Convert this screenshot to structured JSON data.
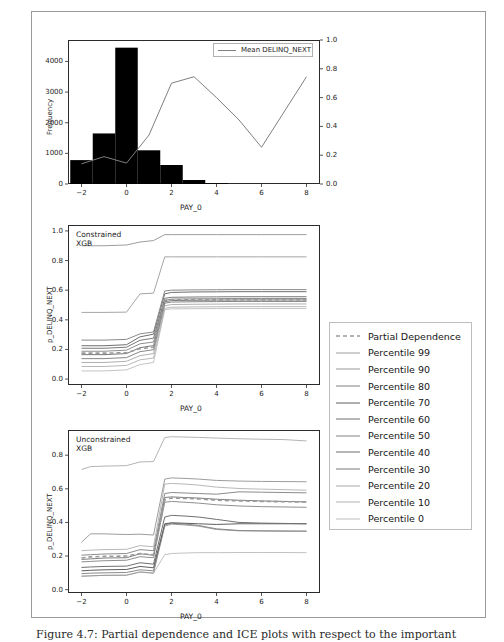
{
  "figure": {
    "caption": "Figure 4.7: Partial dependence and ICE plots with respect to the important",
    "background": "#ffffff",
    "frame_color": "#9a9a9a"
  },
  "chart_data": [
    {
      "id": "top-histogram",
      "type": "bar",
      "title": "",
      "xlabel": "PAY_0",
      "ylabel": "Frequency",
      "y2label": "",
      "xlim": [
        -2.6,
        8.6
      ],
      "ylim": [
        0,
        4700
      ],
      "y2lim": [
        0.0,
        1.0
      ],
      "xticks": [
        -2,
        0,
        2,
        4,
        6,
        8
      ],
      "yticks": [
        0,
        1000,
        2000,
        3000,
        4000
      ],
      "y2ticks": [
        0.0,
        0.2,
        0.4,
        0.6,
        0.8,
        1.0
      ],
      "grid": false,
      "bar_color": "#000000",
      "categories": [
        -2,
        -1,
        0,
        1,
        2,
        3,
        4
      ],
      "values": [
        780,
        1650,
        4450,
        1100,
        620,
        130,
        25
      ],
      "series": [
        {
          "name": "Mean DELINQ_NEXT",
          "type": "line",
          "color": "#7f7f7f",
          "axis": "y2",
          "x": [
            -2,
            -1,
            0,
            1,
            2,
            3,
            4,
            5,
            6,
            7,
            8
          ],
          "values": [
            0.14,
            0.19,
            0.145,
            0.34,
            0.7,
            0.745,
            0.6,
            0.445,
            0.255,
            0.5,
            0.745
          ]
        }
      ],
      "legend": {
        "position": "upper center",
        "entries": [
          "Mean DELINQ_NEXT"
        ]
      }
    },
    {
      "id": "middle-constrained",
      "type": "line",
      "annotation": "Constrained\nXGB",
      "xlabel": "PAY_0",
      "ylabel": "p_DELINQ_NEXT",
      "xlim": [
        -2.6,
        8.6
      ],
      "ylim": [
        -0.04,
        1.04
      ],
      "xticks": [
        -2,
        0,
        2,
        4,
        6,
        8
      ],
      "yticks": [
        0.0,
        0.2,
        0.4,
        0.6,
        0.8,
        1.0
      ],
      "grid": false,
      "x": [
        -2,
        -1,
        0,
        0.6,
        1.2,
        1.7,
        2,
        3,
        4,
        5,
        6,
        7,
        8
      ],
      "series": [
        {
          "name": "Partial Dependence",
          "dashed": true,
          "color": "#9a9a9a",
          "values": [
            0.175,
            0.175,
            0.178,
            0.205,
            0.215,
            0.53,
            0.535,
            0.535,
            0.535,
            0.535,
            0.535,
            0.535,
            0.535
          ]
        },
        {
          "name": "Percentile 99",
          "color": "#9d9d9d",
          "values": [
            0.9,
            0.9,
            0.905,
            0.925,
            0.935,
            0.975,
            0.975,
            0.975,
            0.975,
            0.975,
            0.975,
            0.975,
            0.975
          ]
        },
        {
          "name": "Percentile 90",
          "color": "#a6a6a6",
          "values": [
            0.45,
            0.45,
            0.452,
            0.575,
            0.58,
            0.825,
            0.825,
            0.825,
            0.825,
            0.825,
            0.825,
            0.825,
            0.825
          ]
        },
        {
          "name": "Percentile 80",
          "color": "#8a8a8a",
          "values": [
            0.263,
            0.263,
            0.268,
            0.305,
            0.318,
            0.595,
            0.6,
            0.602,
            0.603,
            0.604,
            0.604,
            0.604,
            0.604
          ]
        },
        {
          "name": "Percentile 70",
          "color": "#6e6e6e",
          "values": [
            0.225,
            0.225,
            0.232,
            0.285,
            0.303,
            0.575,
            0.585,
            0.588,
            0.589,
            0.59,
            0.59,
            0.59,
            0.59
          ]
        },
        {
          "name": "Percentile 60",
          "color": "#7a7a7a",
          "values": [
            0.208,
            0.208,
            0.215,
            0.262,
            0.276,
            0.545,
            0.552,
            0.554,
            0.555,
            0.556,
            0.556,
            0.556,
            0.556
          ]
        },
        {
          "name": "Percentile 50",
          "color": "#8f8f8f",
          "values": [
            0.188,
            0.188,
            0.195,
            0.238,
            0.25,
            0.532,
            0.54,
            0.542,
            0.543,
            0.544,
            0.544,
            0.544,
            0.544
          ]
        },
        {
          "name": "Percentile 40",
          "color": "#787878",
          "values": [
            0.165,
            0.165,
            0.172,
            0.212,
            0.226,
            0.522,
            0.53,
            0.532,
            0.533,
            0.534,
            0.534,
            0.534,
            0.534
          ]
        },
        {
          "name": "Percentile 30",
          "color": "#868686",
          "values": [
            0.138,
            0.138,
            0.145,
            0.185,
            0.198,
            0.512,
            0.52,
            0.522,
            0.523,
            0.524,
            0.524,
            0.524,
            0.524
          ]
        },
        {
          "name": "Percentile 20",
          "color": "#b0b0b0",
          "values": [
            0.112,
            0.112,
            0.12,
            0.158,
            0.172,
            0.495,
            0.503,
            0.505,
            0.506,
            0.507,
            0.507,
            0.507,
            0.507
          ]
        },
        {
          "name": "Percentile 10",
          "color": "#b8b8b8",
          "values": [
            0.085,
            0.085,
            0.092,
            0.13,
            0.142,
            0.478,
            0.485,
            0.487,
            0.488,
            0.489,
            0.489,
            0.489,
            0.489
          ]
        },
        {
          "name": "Percentile 0",
          "color": "#c4c4c4",
          "values": [
            0.055,
            0.055,
            0.062,
            0.098,
            0.112,
            0.468,
            0.474,
            0.475,
            0.476,
            0.476,
            0.476,
            0.476,
            0.476
          ]
        }
      ]
    },
    {
      "id": "bottom-unconstrained",
      "type": "line",
      "annotation": "Unconstrained\nXGB",
      "xlabel": "PAY_0",
      "ylabel": "p_DELINQ_NEXT",
      "xlim": [
        -2.6,
        8.6
      ],
      "ylim": [
        -0.02,
        0.95
      ],
      "xticks": [
        -2,
        0,
        2,
        4,
        6,
        8
      ],
      "yticks": [
        0.0,
        0.2,
        0.4,
        0.6,
        0.8
      ],
      "grid": false,
      "x": [
        -2,
        -1.6,
        -1,
        0,
        0.6,
        1.2,
        1.7,
        2,
        2.6,
        3.2,
        4,
        5,
        6,
        7,
        8
      ],
      "series": [
        {
          "name": "Partial Dependence",
          "dashed": true,
          "color": "#9a9a9a",
          "values": [
            0.188,
            0.195,
            0.198,
            0.2,
            0.215,
            0.207,
            0.535,
            0.545,
            0.543,
            0.54,
            0.532,
            0.528,
            0.525,
            0.523,
            0.522
          ]
        },
        {
          "name": "Percentile 99",
          "color": "#b4b4b4",
          "values": [
            0.715,
            0.732,
            0.735,
            0.738,
            0.76,
            0.762,
            0.905,
            0.91,
            0.908,
            0.906,
            0.902,
            0.898,
            0.895,
            0.893,
            0.885
          ]
        },
        {
          "name": "Percentile 90",
          "color": "#9c9c9c",
          "values": [
            0.282,
            0.332,
            0.332,
            0.328,
            0.33,
            0.325,
            0.658,
            0.665,
            0.662,
            0.658,
            0.65,
            0.646,
            0.644,
            0.643,
            0.642
          ]
        },
        {
          "name": "Percentile 80",
          "color": "#b8b8b8",
          "values": [
            0.232,
            0.235,
            0.238,
            0.24,
            0.262,
            0.255,
            0.628,
            0.632,
            0.628,
            0.622,
            0.61,
            0.602,
            0.598,
            0.595,
            0.592
          ]
        },
        {
          "name": "Percentile 70",
          "color": "#8c8c8c",
          "values": [
            0.205,
            0.208,
            0.212,
            0.215,
            0.238,
            0.232,
            0.572,
            0.578,
            0.575,
            0.572,
            0.568,
            0.582,
            0.58,
            0.578,
            0.576
          ]
        },
        {
          "name": "Percentile 60",
          "color": "#7d7d7d",
          "values": [
            0.18,
            0.183,
            0.188,
            0.19,
            0.213,
            0.205,
            0.548,
            0.552,
            0.548,
            0.545,
            0.538,
            0.532,
            0.528,
            0.525,
            0.522
          ]
        },
        {
          "name": "Percentile 50",
          "color": "#8f8f8f",
          "values": [
            0.165,
            0.168,
            0.172,
            0.175,
            0.196,
            0.19,
            0.52,
            0.525,
            0.52,
            0.515,
            0.505,
            0.498,
            0.494,
            0.492,
            0.49
          ]
        },
        {
          "name": "Percentile 40",
          "color": "#707070",
          "values": [
            0.132,
            0.135,
            0.138,
            0.14,
            0.16,
            0.152,
            0.432,
            0.442,
            0.438,
            0.432,
            0.418,
            0.4,
            0.396,
            0.394,
            0.392
          ]
        },
        {
          "name": "Percentile 30",
          "color": "#5e5e5e",
          "values": [
            0.112,
            0.115,
            0.118,
            0.12,
            0.138,
            0.13,
            0.392,
            0.398,
            0.395,
            0.392,
            0.388,
            0.392,
            0.392,
            0.392,
            0.392
          ]
        },
        {
          "name": "Percentile 20",
          "color": "#8a8a8a",
          "values": [
            0.095,
            0.098,
            0.1,
            0.102,
            0.118,
            0.112,
            0.385,
            0.395,
            0.39,
            0.382,
            0.362,
            0.352,
            0.35,
            0.349,
            0.348
          ]
        },
        {
          "name": "Percentile 10",
          "color": "#9a9a9a",
          "values": [
            0.08,
            0.082,
            0.085,
            0.086,
            0.105,
            0.098,
            0.378,
            0.39,
            0.385,
            0.378,
            0.358,
            0.35,
            0.349,
            0.348,
            0.348
          ]
        },
        {
          "name": "Percentile 0",
          "color": "#c2c2c2",
          "values": [
            0.08,
            0.082,
            0.085,
            0.086,
            0.105,
            0.098,
            0.208,
            0.215,
            0.218,
            0.22,
            0.22,
            0.221,
            0.221,
            0.221,
            0.22
          ]
        }
      ]
    }
  ],
  "side_legend": {
    "entries": [
      {
        "label": "Partial Dependence",
        "color": "#9a9a9a",
        "dashed": true
      },
      {
        "label": "Percentile 99",
        "color": "#a8a8a8",
        "dashed": false
      },
      {
        "label": "Percentile 90",
        "color": "#9e9e9e",
        "dashed": false
      },
      {
        "label": "Percentile 80",
        "color": "#8a8a8a",
        "dashed": false
      },
      {
        "label": "Percentile 70",
        "color": "#6e6e6e",
        "dashed": false
      },
      {
        "label": "Percentile 60",
        "color": "#7a7a7a",
        "dashed": false
      },
      {
        "label": "Percentile 50",
        "color": "#8f8f8f",
        "dashed": false
      },
      {
        "label": "Percentile 40",
        "color": "#787878",
        "dashed": false
      },
      {
        "label": "Percentile 30",
        "color": "#868686",
        "dashed": false
      },
      {
        "label": "Percentile 20",
        "color": "#b0b0b0",
        "dashed": false
      },
      {
        "label": "Percentile 10",
        "color": "#b8b8b8",
        "dashed": false
      },
      {
        "label": "Percentile 0",
        "color": "#c4c4c4",
        "dashed": false
      }
    ]
  }
}
